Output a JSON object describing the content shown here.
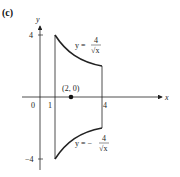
{
  "figure": {
    "panel_label": "(c)",
    "axes": {
      "x_label": "x",
      "y_label": "y",
      "x_ticks": [
        "0",
        "1",
        "4"
      ],
      "y_ticks": [
        "4",
        "−4"
      ]
    },
    "point": {
      "label": "(2, 0)",
      "x": 2,
      "y": 0
    },
    "upper_curve": {
      "lhs": "y =",
      "numerator": "4",
      "denominator": "√x"
    },
    "lower_curve": {
      "lhs": "y = −",
      "numerator": "4",
      "denominator": "√x"
    },
    "colors": {
      "stroke": "#222222",
      "background": "#ffffff"
    }
  }
}
